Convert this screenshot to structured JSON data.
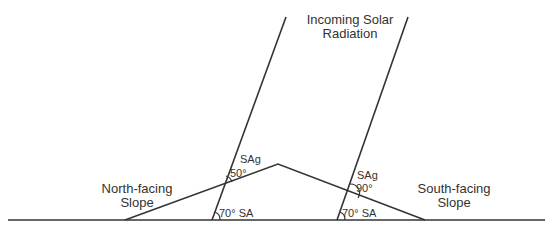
{
  "diagram": {
    "title": "Incoming Solar Radiation",
    "title_line1": "Incoming Solar",
    "title_line2": "Radiation",
    "north_slope": {
      "line1": "North-facing",
      "line2": "Slope",
      "slope_angle_label": "50°",
      "slope_angle_name": "SAg",
      "sun_angle_label": "70°",
      "sun_angle_name": "SA"
    },
    "south_slope": {
      "line1": "South-facing",
      "line2": "Slope",
      "slope_angle_label": "90°",
      "slope_angle_name": "SAg",
      "sun_angle_label": "70°",
      "sun_angle_name": "SA"
    },
    "colors": {
      "line": "#333333",
      "text": "#333333",
      "background": "#ffffff"
    }
  }
}
